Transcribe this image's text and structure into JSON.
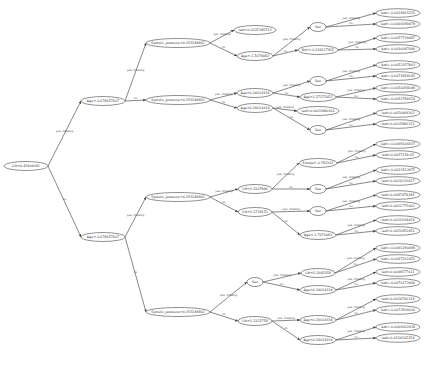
{
  "diagram": {
    "type": "decision-tree",
    "nodes": [
      {
        "id": "n0",
        "label": "Lift<0.42906691",
        "x": 26,
        "y": 166,
        "rx": 22
      },
      {
        "id": "n1",
        "label": "Age<-0.678657667",
        "x": 103,
        "y": 101,
        "rx": 22
      },
      {
        "id": "n2",
        "label": "Age<-0.678657667",
        "x": 103,
        "y": 237,
        "rx": 22
      },
      {
        "id": "n3",
        "label": "Systolic_pressure<0.353248862",
        "x": 178,
        "y": 43,
        "rx": 32
      },
      {
        "id": "n4",
        "label": "Systolic_pressure<0.353248862",
        "x": 178,
        "y": 100,
        "rx": 32
      },
      {
        "id": "n5",
        "label": "Systolic_pressure<0.353248862",
        "x": 178,
        "y": 197,
        "rx": 32
      },
      {
        "id": "n6",
        "label": "Systolic_pressure<0.353248862",
        "x": 178,
        "y": 312,
        "rx": 32
      },
      {
        "id": "n7",
        "label": "leaf=0.0325345513",
        "x": 255,
        "y": 30,
        "rx": 21
      },
      {
        "id": "n8",
        "label": "Age<-1.5679082",
        "x": 255,
        "y": 56,
        "rx": 18
      },
      {
        "id": "n9",
        "label": "Sex",
        "x": 318,
        "y": 27,
        "rx": 8
      },
      {
        "id": "n10",
        "label": "Bmi<-0.219217815",
        "x": 318,
        "y": 50,
        "rx": 20
      },
      {
        "id": "n11",
        "label": "Age<0.24614334",
        "x": 255,
        "y": 93,
        "rx": 18
      },
      {
        "id": "n12",
        "label": "Age<0.24614334",
        "x": 255,
        "y": 108,
        "rx": 18
      },
      {
        "id": "n13",
        "label": "Sex",
        "x": 318,
        "y": 81,
        "rx": 8
      },
      {
        "id": "n14",
        "label": "Age<1.27175052",
        "x": 318,
        "y": 97,
        "rx": 18
      },
      {
        "id": "n15",
        "label": "leaf=0.0023480166",
        "x": 318,
        "y": 111,
        "rx": 21
      },
      {
        "id": "n16",
        "label": "Sex",
        "x": 318,
        "y": 130,
        "rx": 8
      },
      {
        "id": "n17",
        "label": "Lift<1.2207896",
        "x": 255,
        "y": 189,
        "rx": 17
      },
      {
        "id": "n18",
        "label": "Lift<1.1739151",
        "x": 255,
        "y": 212,
        "rx": 17
      },
      {
        "id": "n19",
        "label": "Smoke<-0.781163",
        "x": 318,
        "y": 163,
        "rx": 19
      },
      {
        "id": "n20",
        "label": "Sex",
        "x": 318,
        "y": 189,
        "rx": 8
      },
      {
        "id": "n21",
        "label": "Sex",
        "x": 318,
        "y": 211,
        "rx": 8
      },
      {
        "id": "n22",
        "label": "Age<-1.7676083",
        "x": 318,
        "y": 235,
        "rx": 18
      },
      {
        "id": "n23",
        "label": "Sex",
        "x": 255,
        "y": 282,
        "rx": 8
      },
      {
        "id": "n24",
        "label": "Lift<1.2122758",
        "x": 255,
        "y": 321,
        "rx": 17
      },
      {
        "id": "n25",
        "label": "Lift<2.2082358",
        "x": 318,
        "y": 273,
        "rx": 17
      },
      {
        "id": "n26",
        "label": "Age<0.24614334",
        "x": 318,
        "y": 290,
        "rx": 18
      },
      {
        "id": "n27",
        "label": "Age<0.24614334",
        "x": 318,
        "y": 320,
        "rx": 18
      },
      {
        "id": "n28",
        "label": "Age<0.24614334",
        "x": 318,
        "y": 340,
        "rx": 18
      }
    ],
    "leaves": [
      {
        "label": "leaf=-0.0024915321",
        "x": 398,
        "y": 13
      },
      {
        "label": "leaf=-0.0069289479",
        "x": 398,
        "y": 24
      },
      {
        "label": "leaf=-0.0057739487",
        "x": 398,
        "y": 38
      },
      {
        "label": "leaf=-0.0036087096",
        "x": 398,
        "y": 49
      },
      {
        "label": "leaf=-0.0052357863",
        "x": 398,
        "y": 65
      },
      {
        "label": "leaf=-0.0071958182",
        "x": 398,
        "y": 76
      },
      {
        "label": "leaf=-0.0050058049",
        "x": 398,
        "y": 88
      },
      {
        "label": "leaf=-0.0052788324",
        "x": 398,
        "y": 99
      },
      {
        "label": "leaf=0.0050468262",
        "x": 398,
        "y": 113
      },
      {
        "label": "leaf=0.0015896221",
        "x": 398,
        "y": 124
      },
      {
        "label": "leaf=-0.0099106837",
        "x": 398,
        "y": 144
      },
      {
        "label": "leaf=0.0057159-05",
        "x": 398,
        "y": 155
      },
      {
        "label": "leaf=-0.0023513975",
        "x": 398,
        "y": 170
      },
      {
        "label": "leaf=0.0016131827",
        "x": 398,
        "y": 181
      },
      {
        "label": "leaf=0.0087478385",
        "x": 398,
        "y": 195
      },
      {
        "label": "leaf=0.0021775060",
        "x": 398,
        "y": 206
      },
      {
        "label": "leaf=0.0022034424",
        "x": 398,
        "y": 220
      },
      {
        "label": "leaf=0.0051951456",
        "x": 398,
        "y": 231
      },
      {
        "label": "leaf=-0.0091290499",
        "x": 398,
        "y": 248
      },
      {
        "label": "leaf=-0.0097261451",
        "x": 398,
        "y": 259
      },
      {
        "label": "leaf=0.0049577611",
        "x": 398,
        "y": 272
      },
      {
        "label": "leaf=-0.0076172840",
        "x": 398,
        "y": 283
      },
      {
        "label": "leaf=0.0024741119",
        "x": 398,
        "y": 299
      },
      {
        "label": "leaf=-0.0073506606",
        "x": 398,
        "y": 310
      },
      {
        "label": "leaf=-0.0009302438",
        "x": 398,
        "y": 327
      },
      {
        "label": "leaf=0.0224205254",
        "x": 398,
        "y": 338
      }
    ],
    "edges": [
      {
        "from": "n0",
        "to": "n1",
        "label": "yes, missing"
      },
      {
        "from": "n0",
        "to": "n2",
        "label": "no"
      },
      {
        "from": "n1",
        "to": "n3",
        "label": "yes, missing"
      },
      {
        "from": "n1",
        "to": "n4",
        "label": "no"
      },
      {
        "from": "n2",
        "to": "n5",
        "label": "yes, missing"
      },
      {
        "from": "n2",
        "to": "n6",
        "label": "no"
      },
      {
        "from": "n3",
        "to": "n7",
        "label": "yes, missing"
      },
      {
        "from": "n3",
        "to": "n8",
        "label": "no"
      },
      {
        "from": "n8",
        "to": "n9",
        "label": "yes, missing"
      },
      {
        "from": "n8",
        "to": "n10",
        "label": "no"
      },
      {
        "from": "n4",
        "to": "n11",
        "label": "yes, missing"
      },
      {
        "from": "n4",
        "to": "n12",
        "label": "no"
      },
      {
        "from": "n11",
        "to": "n13",
        "label": "yes, missing"
      },
      {
        "from": "n11",
        "to": "n14",
        "label": "no"
      },
      {
        "from": "n12",
        "to": "n15",
        "label": "yes, missing"
      },
      {
        "from": "n12",
        "to": "n16",
        "label": "no"
      },
      {
        "from": "n5",
        "to": "n17",
        "label": "yes, missing"
      },
      {
        "from": "n5",
        "to": "n18",
        "label": "no"
      },
      {
        "from": "n17",
        "to": "n19",
        "label": "yes, missing"
      },
      {
        "from": "n17",
        "to": "n20",
        "label": "no"
      },
      {
        "from": "n18",
        "to": "n21",
        "label": "yes, missing"
      },
      {
        "from": "n18",
        "to": "n22",
        "label": "no"
      },
      {
        "from": "n6",
        "to": "n23",
        "label": "yes, missing"
      },
      {
        "from": "n6",
        "to": "n24",
        "label": "no"
      },
      {
        "from": "n23",
        "to": "n25",
        "label": "yes, missing"
      },
      {
        "from": "n23",
        "to": "n26",
        "label": "no"
      },
      {
        "from": "n24",
        "to": "n27",
        "label": "yes, missing"
      },
      {
        "from": "n24",
        "to": "n28",
        "label": "no"
      }
    ],
    "leaf_edges": [
      {
        "from": "n9",
        "leaves": [
          0,
          1
        ]
      },
      {
        "from": "n10",
        "leaves": [
          2,
          3
        ]
      },
      {
        "from": "n13",
        "leaves": [
          4,
          5
        ]
      },
      {
        "from": "n14",
        "leaves": [
          6,
          7
        ]
      },
      {
        "from": "n16",
        "leaves": [
          8,
          9
        ]
      },
      {
        "from": "n19",
        "leaves": [
          10,
          11
        ]
      },
      {
        "from": "n20",
        "leaves": [
          12,
          13
        ]
      },
      {
        "from": "n21",
        "leaves": [
          14,
          15
        ]
      },
      {
        "from": "n22",
        "leaves": [
          16,
          17
        ]
      },
      {
        "from": "n25",
        "leaves": [
          18,
          19
        ]
      },
      {
        "from": "n26",
        "leaves": [
          20,
          21
        ]
      },
      {
        "from": "n27",
        "leaves": [
          22,
          23
        ]
      },
      {
        "from": "n28",
        "leaves": [
          24,
          25
        ]
      }
    ],
    "edge_labels": {
      "yes": "yes, missing",
      "no": "no"
    }
  }
}
